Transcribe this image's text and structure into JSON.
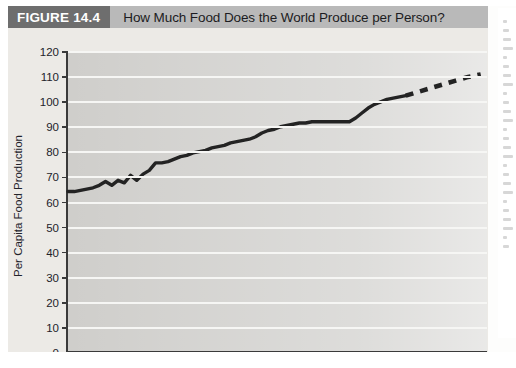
{
  "figure": {
    "tag": "FIGURE 14.4",
    "title": "How Much Food Does the World Produce per Person?"
  },
  "axis": {
    "x_title": "Year",
    "y_title": "Per Capita Food Production"
  },
  "colors": {
    "tag_background": "#6e6e6e",
    "title_background": "#b9b9b9",
    "plot_background": "#cfcecb",
    "gridline": "#f6f6f4",
    "series_line": "#232323",
    "axis": "#3a3a3a",
    "page": "#eceae6"
  },
  "chart_data": {
    "type": "line",
    "title": "How Much Food Does the World Produce per Person?",
    "xlabel": "Year",
    "ylabel": "Per Capita Food Production",
    "xlim": [
      1950,
      2017
    ],
    "ylim": [
      0,
      120
    ],
    "xticks": [
      1950,
      1955,
      1960,
      1965,
      1970,
      1975,
      1980,
      1985,
      1990,
      1995,
      2000,
      2005,
      2010,
      2015
    ],
    "yticks": [
      0,
      10,
      20,
      30,
      40,
      50,
      60,
      70,
      80,
      90,
      100,
      110,
      120
    ],
    "grid": "horizontal",
    "legend": "none",
    "series": [
      {
        "name": "Per capita food production (observed)",
        "style": "solid",
        "x": [
          1950,
          1951,
          1952,
          1953,
          1954,
          1955,
          1956,
          1957,
          1958,
          1959,
          1960,
          1961,
          1962,
          1963,
          1964,
          1965,
          1966,
          1967,
          1968,
          1969,
          1970,
          1971,
          1972,
          1973,
          1974,
          1975,
          1976,
          1977,
          1978,
          1979,
          1980,
          1981,
          1982,
          1983,
          1984,
          1985,
          1986,
          1987,
          1988,
          1989,
          1990,
          1991,
          1992,
          1993,
          1994,
          1995,
          1996,
          1997,
          1998,
          1999,
          2000,
          2001,
          2002,
          2003,
          2004
        ],
        "y": [
          64,
          64,
          64.5,
          65,
          65.5,
          66.5,
          68,
          66.5,
          68.5,
          67.5,
          70.5,
          68.5,
          71,
          72.5,
          75.5,
          75.5,
          76,
          77,
          78,
          78.5,
          79.5,
          80,
          80.5,
          81.5,
          82,
          82.5,
          83.5,
          84,
          84.5,
          85,
          86,
          87.5,
          88.5,
          89,
          90,
          90.5,
          91,
          91.5,
          91.5,
          92,
          92,
          92,
          92,
          92,
          92,
          92,
          93.5,
          95.5,
          97.5,
          99,
          100,
          101,
          101.5,
          102,
          102.5
        ]
      },
      {
        "name": "Per capita food production (projected)",
        "style": "dashed",
        "x": [
          2004,
          2006,
          2008,
          2010,
          2012,
          2014,
          2015,
          2016
        ],
        "y": [
          102.5,
          104,
          105.5,
          107,
          108.5,
          110,
          110.5,
          111
        ]
      }
    ]
  }
}
